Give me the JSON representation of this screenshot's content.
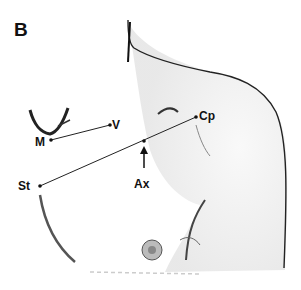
{
  "figure": {
    "panel_label": "B",
    "landmarks": [
      {
        "key": "M",
        "label": "M"
      },
      {
        "key": "V",
        "label": "V"
      },
      {
        "key": "Cp",
        "label": "Cp"
      },
      {
        "key": "Ax",
        "label": "Ax"
      },
      {
        "key": "St",
        "label": "St"
      }
    ],
    "colors": {
      "ink": "#111111",
      "background": "#ffffff"
    }
  }
}
